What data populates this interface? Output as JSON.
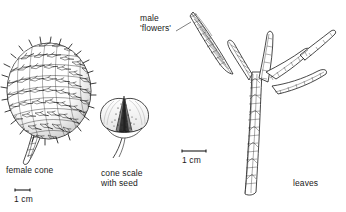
{
  "plate": {
    "background_color": "#ffffff",
    "ink_color": "#1a1a1a",
    "width": 346,
    "height": 212,
    "subject": "conifer-botanical-illustration"
  },
  "labels": {
    "female_cone": "female cone",
    "cone_scale_line1": "cone scale",
    "cone_scale_line2": "with seed",
    "male_line1": "male",
    "male_line2": "'flowers'",
    "leaves": "leaves"
  },
  "scale_bars": {
    "left": {
      "caption": "1 cm"
    },
    "right": {
      "caption": "1 cm"
    }
  }
}
